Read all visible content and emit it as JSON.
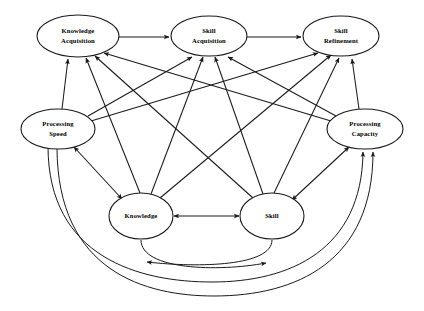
{
  "diagram": {
    "type": "node-link-diagram",
    "width": 424,
    "height": 311,
    "background_color": "#ffffff",
    "stroke_color": "#1a1a1a",
    "nodes": [
      {
        "id": "knowledge_acquisition",
        "label_line1": "Knowledge",
        "label_line2": "Acquisition",
        "cx": 78,
        "cy": 36,
        "rx": 41,
        "ry": 21
      },
      {
        "id": "skill_acquisition",
        "label_line1": "Skill",
        "label_line2": "Acquisition",
        "cx": 209,
        "cy": 36,
        "rx": 38,
        "ry": 20
      },
      {
        "id": "skill_refinement",
        "label_line1": "Skill",
        "label_line2": "Refinement",
        "cx": 341,
        "cy": 36,
        "rx": 38,
        "ry": 20
      },
      {
        "id": "processing_speed",
        "label_line1": "Processing",
        "label_line2": "Speed",
        "cx": 58,
        "cy": 129,
        "rx": 37,
        "ry": 20
      },
      {
        "id": "processing_capacity",
        "label_line1": "Processing",
        "label_line2": "Capacity",
        "cx": 365,
        "cy": 129,
        "rx": 38,
        "ry": 20
      },
      {
        "id": "knowledge",
        "label_line1": "Knowledge",
        "label_line2": "",
        "cx": 141,
        "cy": 216,
        "rx": 32,
        "ry": 23
      },
      {
        "id": "skill",
        "label_line1": "Skill",
        "label_line2": "",
        "cx": 272,
        "cy": 216,
        "rx": 32,
        "ry": 23
      }
    ],
    "edges": [
      {
        "from": "knowledge_acquisition",
        "to": "skill_acquisition",
        "style": "straight",
        "direction": "one-way"
      },
      {
        "from": "skill_acquisition",
        "to": "skill_refinement",
        "style": "straight",
        "direction": "one-way"
      },
      {
        "from": "processing_speed",
        "to": "knowledge_acquisition",
        "style": "straight",
        "direction": "one-way"
      },
      {
        "from": "processing_speed",
        "to": "skill_acquisition",
        "style": "straight",
        "direction": "one-way"
      },
      {
        "from": "processing_speed",
        "to": "skill_refinement",
        "style": "straight",
        "direction": "one-way"
      },
      {
        "from": "processing_capacity",
        "to": "knowledge_acquisition",
        "style": "straight",
        "direction": "one-way"
      },
      {
        "from": "processing_capacity",
        "to": "skill_acquisition",
        "style": "straight",
        "direction": "one-way"
      },
      {
        "from": "processing_capacity",
        "to": "skill_refinement",
        "style": "straight",
        "direction": "one-way"
      },
      {
        "from": "knowledge",
        "to": "knowledge_acquisition",
        "style": "straight",
        "direction": "one-way"
      },
      {
        "from": "knowledge",
        "to": "skill_acquisition",
        "style": "straight",
        "direction": "one-way"
      },
      {
        "from": "knowledge",
        "to": "skill_refinement",
        "style": "straight",
        "direction": "one-way"
      },
      {
        "from": "skill",
        "to": "knowledge_acquisition",
        "style": "straight",
        "direction": "one-way"
      },
      {
        "from": "skill",
        "to": "skill_acquisition",
        "style": "straight",
        "direction": "one-way"
      },
      {
        "from": "skill",
        "to": "skill_refinement",
        "style": "straight",
        "direction": "one-way"
      },
      {
        "from": "processing_speed",
        "to": "knowledge",
        "style": "straight",
        "direction": "two-way"
      },
      {
        "from": "processing_capacity",
        "to": "skill",
        "style": "straight",
        "direction": "two-way"
      },
      {
        "from": "knowledge",
        "to": "skill",
        "style": "straight",
        "direction": "two-way"
      },
      {
        "from": "skill",
        "to": "knowledge",
        "style": "arc",
        "direction": "one-way"
      },
      {
        "from": "knowledge",
        "to": "skill",
        "style": "arc",
        "direction": "one-way"
      },
      {
        "from": "processing_speed",
        "to": "processing_capacity",
        "style": "arc",
        "direction": "one-way"
      },
      {
        "from": "processing_speed",
        "to": "processing_capacity",
        "style": "arc",
        "direction": "one-way"
      }
    ]
  }
}
